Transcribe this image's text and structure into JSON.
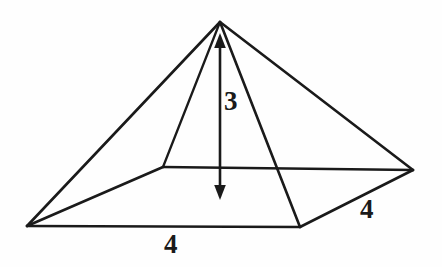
{
  "figure": {
    "kind": "square-pyramid-diagram",
    "background_color": "#fefefe",
    "stroke_color": "#1a1a1a",
    "apex_label": "",
    "labels": {
      "height": "3",
      "base_front": "4",
      "base_right": "4"
    },
    "vertices": {
      "apex": [
        220,
        22
      ],
      "base_left": [
        27,
        226
      ],
      "base_front": [
        300,
        227
      ],
      "base_right": [
        413,
        170
      ],
      "base_back": [
        163,
        167
      ]
    },
    "height_arrow": {
      "x": 220,
      "top_y": 35,
      "bottom_y": 198,
      "double_headed": true
    },
    "edges": [
      {
        "name": "apex-to-base-left",
        "from": "apex",
        "to": "base_left"
      },
      {
        "name": "apex-to-base-front",
        "from": "apex",
        "to": "base_front"
      },
      {
        "name": "apex-to-base-right",
        "from": "apex",
        "to": "base_right"
      },
      {
        "name": "apex-to-base-back",
        "from": "apex",
        "to": "base_back"
      },
      {
        "name": "base-left-to-base-front",
        "from": "base_left",
        "to": "base_front"
      },
      {
        "name": "base-front-to-base-right",
        "from": "base_front",
        "to": "base_right"
      },
      {
        "name": "base-right-to-base-back",
        "from": "base_right",
        "to": "base_back"
      },
      {
        "name": "base-back-to-base-left",
        "from": "base_back",
        "to": "base_left"
      }
    ]
  }
}
